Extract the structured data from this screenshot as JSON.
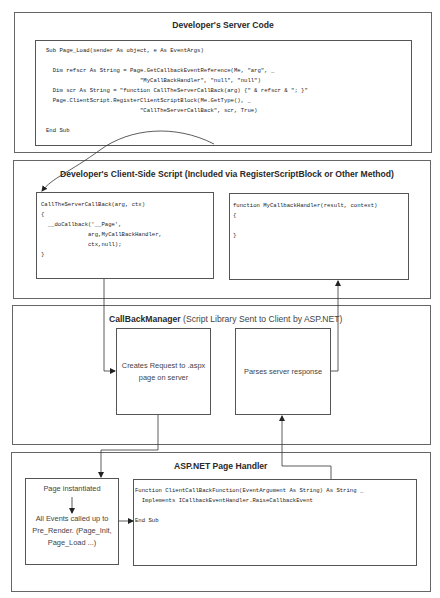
{
  "diagram": {
    "server_section": {
      "title": "Developer's Server Code",
      "code": "Sub Page_Load(sender As object, e As EventArgs)\n\n  Dim refscr As String = Page.GetCallbackEventReference(Me, \"arg\", _\n                            \"MyCallBackHandler\", \"null\", \"null\")\n  Dim scr As String = \"function CallTheServerCallBack(arg) {\" & refscr & \"; }\"\n  Page.ClientScript.RegisterClientScriptBlock(Me.GetType(), _\n                            \"CallTheServerCallBack\", scr, True)\n\nEnd Sub"
    },
    "client_section": {
      "title": "Developer's Client-Side Script (Included via RegisterScriptBlock or Other Method)",
      "call_code": "CallTheServerCallBack(arg, ctx)\n{\n  __doCallback('__Page',\n              arg,MyCallBackHandler,\n              ctx,null);\n}",
      "handler_code": "function MyCallbackHandler(result, context)\n{\n\n}"
    },
    "callback_manager_section": {
      "title_bold": "CallBackManager",
      "title_rest": " (Script Library Sent to Client by ASP.NET)",
      "request_box": "Creates Request to .aspx page on server",
      "parse_box": "Parses server response"
    },
    "page_handler_section": {
      "title": "ASP.NET Page Handler",
      "page_box_top": "Page instantiated",
      "page_box_bottom": "All Events called up to Pre_Render. (Page_Init, Page_Load ...)",
      "function_code": "Function ClientCallBackFunction(EventArgument As String) As String _\n  Implements ICallbackEventHandler.RaiseCallbackEvent\n\nEnd Sub"
    }
  }
}
